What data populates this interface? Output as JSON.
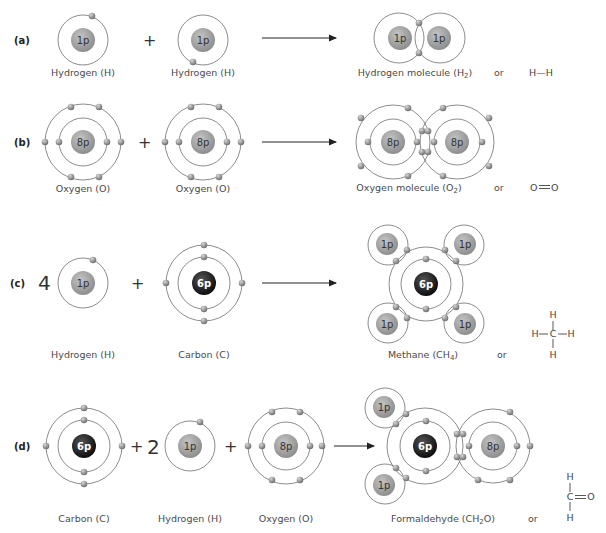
{
  "figure": {
    "colors": {
      "light_nucleus": "#9a9a9a",
      "dark_nucleus": "#1e1e1e",
      "electron": "#8c8c8c",
      "orbit": "#6e6e6e",
      "text": "#4a4a4a"
    },
    "rows": [
      {
        "id": "a",
        "row_label": "(a)",
        "reactants": [
          {
            "coef": "",
            "nucleus": "1p",
            "label": "Hydrogen (H)"
          },
          {
            "coef": "",
            "nucleus": "1p",
            "label": "Hydrogen (H)"
          }
        ],
        "operators": [
          "+"
        ],
        "product": {
          "nuclei": [
            "1p",
            "1p"
          ],
          "label_main": "Hydrogen molecule (H",
          "label_sub": "2",
          "label_end": ")"
        },
        "or_text": "or",
        "structural_formula": {
          "text": "H—H"
        }
      },
      {
        "id": "b",
        "row_label": "(b)",
        "reactants": [
          {
            "coef": "",
            "nucleus": "8p",
            "label": "Oxygen (O)"
          },
          {
            "coef": "",
            "nucleus": "8p",
            "label": "Oxygen (O)"
          }
        ],
        "operators": [
          "+"
        ],
        "product": {
          "nuclei": [
            "8p",
            "8p"
          ],
          "label_main": "Oxygen molecule (O",
          "label_sub": "2",
          "label_end": ")"
        },
        "or_text": "or",
        "structural_formula": {
          "left": "O",
          "right": "O",
          "bond": "double"
        }
      },
      {
        "id": "c",
        "row_label": "(c)",
        "reactants": [
          {
            "coef": "4",
            "nucleus": "1p",
            "label": "Hydrogen (H)"
          },
          {
            "coef": "",
            "nucleus": "6p",
            "label": "Carbon (C)"
          }
        ],
        "operators": [
          "+"
        ],
        "product": {
          "nuclei": [
            "6p",
            "1p",
            "1p",
            "1p",
            "1p"
          ],
          "label_main": "Methane (CH",
          "label_sub": "4",
          "label_end": ")"
        },
        "or_text": "or",
        "structural_formula": {
          "center": "C",
          "top": "H",
          "bottom": "H",
          "left": "H",
          "right": "H"
        }
      },
      {
        "id": "d",
        "row_label": "(d)",
        "reactants": [
          {
            "coef": "",
            "nucleus": "6p",
            "label": "Carbon (C)"
          },
          {
            "coef": "2",
            "nucleus": "1p",
            "label": "Hydrogen (H)"
          },
          {
            "coef": "",
            "nucleus": "8p",
            "label": "Oxygen (O)"
          }
        ],
        "operators": [
          "+",
          "+"
        ],
        "product": {
          "nuclei": [
            "1p",
            "1p",
            "6p",
            "8p"
          ],
          "label_main": "Formaldehyde (CH",
          "label_sub": "2",
          "label_end": "O)"
        },
        "or_text": "or",
        "structural_formula": {
          "center": "C",
          "top": "H",
          "bottom": "H",
          "right": "O",
          "bond_right": "double"
        }
      }
    ]
  }
}
